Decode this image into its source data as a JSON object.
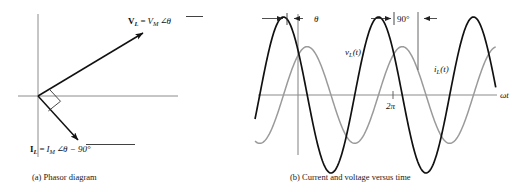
{
  "figure": {
    "panel_a": {
      "caption": "(a) Phasor diagram",
      "voltage_phasor": {
        "bold_symbol": "V",
        "bold_subscript": "L",
        "equals": "=",
        "magnitude": "V",
        "magnitude_subscript": "M",
        "angle_glyph": "∠",
        "angle_value": "θ",
        "full_text": "V_L = V_M ∠θ"
      },
      "current_phasor": {
        "bold_symbol": "I",
        "bold_subscript": "L",
        "equals": "=",
        "magnitude": "I",
        "magnitude_subscript": "M",
        "angle_glyph": "∠",
        "angle_value": "θ − 90°",
        "full_text": "I_L = I_M ∠θ − 90°"
      },
      "right_angle_marker": "90-degree-square"
    },
    "panel_b": {
      "caption": "(b) Current and voltage versus time",
      "axis_label": "ωt",
      "tick_label": "2π",
      "voltage_curve_label": {
        "symbol": "v",
        "subscript": "L",
        "argument": "(t)",
        "full_text": "v_L(t)"
      },
      "current_curve_label": {
        "symbol": "i",
        "subscript": "L",
        "argument": "(t)",
        "full_text": "i_L(t)"
      },
      "dimension_theta": "θ",
      "dimension_ninety": "90°"
    }
  },
  "chart_data": {
    "type": "line",
    "title": "",
    "xlabel": "ωt",
    "ylabel": "",
    "xlim": [
      -1.6,
      13.6
    ],
    "ylim": [
      -1.25,
      1.25
    ],
    "grid": false,
    "legend": "inline-curve-labels",
    "xticks": [
      6.283185
    ],
    "xticklabels": [
      "2π"
    ],
    "series": [
      {
        "name": "v_L(t)",
        "color": "#111111",
        "amplitude": 1.0,
        "phase_deg": 55,
        "form": "VM*cos(wt + theta)",
        "linewidth": 1.7
      },
      {
        "name": "i_L(t)",
        "color": "#9a9a9a",
        "amplitude": 0.62,
        "phase_deg": -35,
        "form": "IM*cos(wt + theta - 90)",
        "linewidth": 1.5
      }
    ],
    "annotations": [
      {
        "label": "θ",
        "type": "dimension",
        "between_deg": [
          0,
          55
        ]
      },
      {
        "label": "90°",
        "type": "dimension",
        "between_deg": [
          55,
          145
        ]
      }
    ]
  },
  "colors": {
    "voltage": "#111111",
    "current": "#9a9a9a",
    "axis": "#8c8c8c",
    "text": "#1a1a1a"
  }
}
